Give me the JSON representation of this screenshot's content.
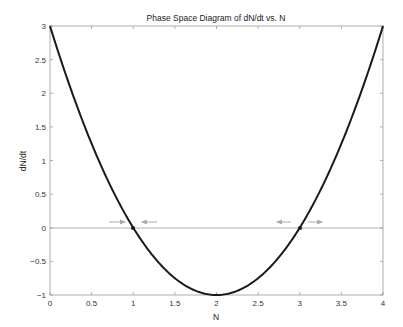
{
  "chart_data": {
    "type": "line",
    "title": "Phase Space Diagram of dN/dt vs. N",
    "xlabel": "N",
    "ylabel": "dN/dt",
    "xlim": [
      0,
      4
    ],
    "ylim": [
      -1,
      3
    ],
    "grid": false,
    "legend": null,
    "x_ticks": [
      "0",
      "0.5",
      "1",
      "1.5",
      "2",
      "2.5",
      "3",
      "3.5",
      "4"
    ],
    "y_ticks": [
      "−1",
      "−0.5",
      "0",
      "0.5",
      "1",
      "1.5",
      "2",
      "2.5",
      "3"
    ],
    "series": [
      {
        "name": "dN/dt = (N-1)(N-3)",
        "x": [
          0,
          0.25,
          0.5,
          0.75,
          1,
          1.25,
          1.5,
          1.75,
          2,
          2.25,
          2.5,
          2.75,
          3,
          3.25,
          3.5,
          3.75,
          4
        ],
        "values": [
          3,
          2.0625,
          1.25,
          0.5625,
          0,
          -0.4375,
          -0.75,
          -0.9375,
          -1,
          -0.9375,
          -0.75,
          -0.4375,
          0,
          0.5625,
          1.25,
          2.0625,
          3
        ]
      }
    ],
    "reference_lines": [
      {
        "y": 0
      }
    ],
    "equilibria": [
      {
        "N": 1,
        "dNdt": 0,
        "stability": "stable",
        "arrows": "converging"
      },
      {
        "N": 3,
        "dNdt": 0,
        "stability": "unstable",
        "arrows": "diverging"
      }
    ],
    "colors": {
      "curve": "#1a1a1a",
      "axes": "#888888",
      "arrows": "#999999"
    }
  }
}
